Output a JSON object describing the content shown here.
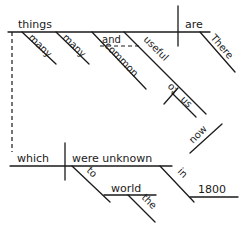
{
  "diagram": {
    "type": "sentence-diagram",
    "words": {
      "subject": "things",
      "verb": "are",
      "expletive": "There",
      "mod1": "many",
      "mod2": "many",
      "conj": "and",
      "adj_common": "common",
      "adj_useful": "useful",
      "prep_to": "to",
      "obj_us": "us",
      "adv_now": "now",
      "rel_pronoun": "which",
      "rel_verb": "were unknown",
      "prep_to2": "to",
      "obj_world": "world",
      "art_the": "the",
      "prep_in": "in",
      "obj_year": "1800"
    }
  }
}
